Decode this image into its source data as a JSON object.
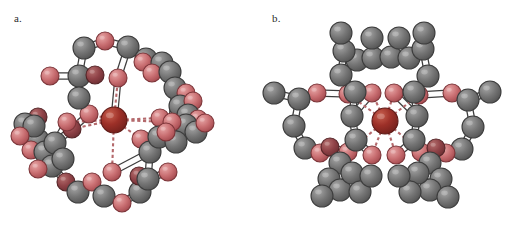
{
  "figure": {
    "background_color": "#ffffff",
    "width": 517,
    "height": 228,
    "panels": [
      {
        "id": "a",
        "label": "a.",
        "caption_text": "a.",
        "description": "Ball-and-stick molecular model of a macrocyclic host (crown-ether / cryptand type) viewed roughly down the cavity axis, with a central dark-red cation bound by dashed coordination bonds to surrounding oxygen atoms."
      },
      {
        "id": "b",
        "label": "b.",
        "caption_text": "b.",
        "description": "Ball-and-stick molecular model of a related macrocyclic host viewed edge-on, with a central dark-red cation radiating dashed coordination bonds to six oxygen atoms of the cavity."
      }
    ]
  },
  "legend": {
    "atom_types": [
      {
        "name": "carbon",
        "color": "#6e6e6e",
        "highlight": "#9a9a9a",
        "radius_px": 11
      },
      {
        "name": "oxygen",
        "color": "#c4656a",
        "highlight": "#e09a9c",
        "radius_px": 9
      },
      {
        "name": "oxygen-shaded",
        "color": "#8d3d42",
        "highlight": "#b56a6c",
        "radius_px": 9
      },
      {
        "name": "metal-cation",
        "color": "#9c2f2a",
        "highlight": "#c96056",
        "radius_px": 13
      }
    ],
    "bond_types": [
      {
        "name": "covalent-bond",
        "style": "solid-white-cylinder",
        "color": "#ffffff",
        "outline": "#3a3a3a"
      },
      {
        "name": "coordination-bond",
        "style": "dashed",
        "color": "#b06a6a"
      }
    ]
  },
  "structure_a": {
    "atoms": [
      {
        "id": 1,
        "type": "metal-cation",
        "x": 114,
        "y": 120,
        "r": 13
      },
      {
        "id": 2,
        "type": "oxygen",
        "x": 118,
        "y": 78,
        "r": 9
      },
      {
        "id": 3,
        "type": "oxygen",
        "x": 89,
        "y": 114,
        "r": 9
      },
      {
        "id": 4,
        "type": "oxygen",
        "x": 160,
        "y": 118,
        "r": 9
      },
      {
        "id": 5,
        "type": "oxygen",
        "x": 112,
        "y": 172,
        "r": 9
      },
      {
        "id": 6,
        "type": "oxygen-shaded",
        "x": 72,
        "y": 129,
        "r": 9
      },
      {
        "id": 7,
        "type": "oxygen",
        "x": 141,
        "y": 139,
        "r": 9
      },
      {
        "id": 8,
        "type": "carbon",
        "x": 84,
        "y": 48,
        "r": 11
      },
      {
        "id": 9,
        "type": "oxygen",
        "x": 105,
        "y": 41,
        "r": 9
      },
      {
        "id": 10,
        "type": "carbon",
        "x": 128,
        "y": 47,
        "r": 11
      },
      {
        "id": 11,
        "type": "carbon",
        "x": 146,
        "y": 59,
        "r": 11
      },
      {
        "id": 12,
        "type": "oxygen",
        "x": 143,
        "y": 62,
        "r": 9
      },
      {
        "id": 13,
        "type": "carbon",
        "x": 162,
        "y": 63,
        "r": 11
      },
      {
        "id": 14,
        "type": "oxygen",
        "x": 152,
        "y": 73,
        "r": 9
      },
      {
        "id": 15,
        "type": "carbon",
        "x": 170,
        "y": 72,
        "r": 11
      },
      {
        "id": 16,
        "type": "carbon",
        "x": 175,
        "y": 88,
        "r": 11
      },
      {
        "id": 17,
        "type": "oxygen",
        "x": 186,
        "y": 93,
        "r": 9
      },
      {
        "id": 18,
        "type": "carbon",
        "x": 180,
        "y": 106,
        "r": 11
      },
      {
        "id": 19,
        "type": "oxygen",
        "x": 193,
        "y": 101,
        "r": 9
      },
      {
        "id": 20,
        "type": "carbon",
        "x": 188,
        "y": 115,
        "r": 11
      },
      {
        "id": 21,
        "type": "oxygen",
        "x": 198,
        "y": 119,
        "r": 9
      },
      {
        "id": 22,
        "type": "carbon",
        "x": 186,
        "y": 125,
        "r": 11
      },
      {
        "id": 23,
        "type": "oxygen",
        "x": 172,
        "y": 122,
        "r": 9
      },
      {
        "id": 24,
        "type": "carbon",
        "x": 196,
        "y": 132,
        "r": 11
      },
      {
        "id": 25,
        "type": "oxygen",
        "x": 205,
        "y": 123,
        "r": 9
      },
      {
        "id": 26,
        "type": "carbon",
        "x": 79,
        "y": 76,
        "r": 11
      },
      {
        "id": 27,
        "type": "oxygen-shaded",
        "x": 95,
        "y": 75,
        "r": 9
      },
      {
        "id": 28,
        "type": "carbon",
        "x": 79,
        "y": 98,
        "r": 11
      },
      {
        "id": 29,
        "type": "oxygen",
        "x": 50,
        "y": 76,
        "r": 9
      },
      {
        "id": 30,
        "type": "oxygen-shaded",
        "x": 38,
        "y": 117,
        "r": 9
      },
      {
        "id": 31,
        "type": "carbon",
        "x": 25,
        "y": 124,
        "r": 11
      },
      {
        "id": 32,
        "type": "carbon",
        "x": 38,
        "y": 140,
        "r": 11
      },
      {
        "id": 33,
        "type": "oxygen",
        "x": 31,
        "y": 150,
        "r": 9
      },
      {
        "id": 34,
        "type": "carbon",
        "x": 45,
        "y": 152,
        "r": 11
      },
      {
        "id": 35,
        "type": "carbon",
        "x": 55,
        "y": 143,
        "r": 11
      },
      {
        "id": 36,
        "type": "oxygen",
        "x": 67,
        "y": 122,
        "r": 9
      },
      {
        "id": 37,
        "type": "carbon",
        "x": 52,
        "y": 166,
        "r": 11
      },
      {
        "id": 38,
        "type": "oxygen",
        "x": 38,
        "y": 169,
        "r": 9
      },
      {
        "id": 39,
        "type": "oxygen-shaded",
        "x": 66,
        "y": 182,
        "r": 9
      },
      {
        "id": 40,
        "type": "carbon",
        "x": 78,
        "y": 192,
        "r": 11
      },
      {
        "id": 41,
        "type": "oxygen",
        "x": 92,
        "y": 182,
        "r": 9
      },
      {
        "id": 42,
        "type": "carbon",
        "x": 104,
        "y": 196,
        "r": 11
      },
      {
        "id": 43,
        "type": "oxygen",
        "x": 122,
        "y": 203,
        "r": 9
      },
      {
        "id": 44,
        "type": "carbon",
        "x": 140,
        "y": 192,
        "r": 11
      },
      {
        "id": 45,
        "type": "oxygen-shaded",
        "x": 139,
        "y": 176,
        "r": 9
      },
      {
        "id": 46,
        "type": "carbon",
        "x": 148,
        "y": 179,
        "r": 11
      },
      {
        "id": 47,
        "type": "oxygen",
        "x": 168,
        "y": 172,
        "r": 9
      },
      {
        "id": 48,
        "type": "carbon",
        "x": 150,
        "y": 152,
        "r": 11
      },
      {
        "id": 49,
        "type": "carbon",
        "x": 159,
        "y": 137,
        "r": 11
      },
      {
        "id": 50,
        "type": "carbon",
        "x": 176,
        "y": 142,
        "r": 11
      },
      {
        "id": 51,
        "type": "oxygen",
        "x": 166,
        "y": 132,
        "r": 9
      },
      {
        "id": 52,
        "type": "carbon",
        "x": 34,
        "y": 126,
        "r": 11
      },
      {
        "id": 53,
        "type": "oxygen",
        "x": 20,
        "y": 136,
        "r": 9
      },
      {
        "id": 54,
        "type": "carbon",
        "x": 63,
        "y": 159,
        "r": 11
      }
    ],
    "covalent_bonds": [
      [
        8,
        9
      ],
      [
        9,
        10
      ],
      [
        10,
        11
      ],
      [
        11,
        13
      ],
      [
        13,
        15
      ],
      [
        15,
        16
      ],
      [
        16,
        18
      ],
      [
        18,
        20
      ],
      [
        20,
        22
      ],
      [
        22,
        24
      ],
      [
        8,
        26
      ],
      [
        26,
        28
      ],
      [
        28,
        3
      ],
      [
        26,
        29
      ],
      [
        26,
        27
      ],
      [
        31,
        32
      ],
      [
        32,
        34
      ],
      [
        34,
        35
      ],
      [
        35,
        36
      ],
      [
        34,
        37
      ],
      [
        37,
        39
      ],
      [
        39,
        40
      ],
      [
        40,
        41
      ],
      [
        41,
        42
      ],
      [
        42,
        43
      ],
      [
        43,
        44
      ],
      [
        44,
        46
      ],
      [
        46,
        47
      ],
      [
        46,
        48
      ],
      [
        48,
        49
      ],
      [
        49,
        50
      ],
      [
        49,
        7
      ],
      [
        48,
        5
      ],
      [
        16,
        23
      ],
      [
        22,
        4
      ],
      [
        20,
        21
      ],
      [
        24,
        25
      ],
      [
        18,
        19
      ],
      [
        2,
        10
      ],
      [
        2,
        1
      ],
      [
        31,
        30
      ],
      [
        32,
        33
      ],
      [
        37,
        38
      ],
      [
        35,
        6
      ],
      [
        6,
        3
      ],
      [
        13,
        14
      ],
      [
        11,
        12
      ],
      [
        52,
        53
      ]
    ],
    "coordination_bonds": [
      [
        1,
        2
      ],
      [
        1,
        3
      ],
      [
        1,
        4
      ],
      [
        1,
        5
      ],
      [
        1,
        6
      ],
      [
        1,
        7
      ],
      [
        1,
        23
      ],
      [
        1,
        36
      ]
    ],
    "atom_count": 54,
    "central_cation_position": {
      "x": 114,
      "y": 120
    }
  },
  "structure_b": {
    "atoms": [
      {
        "id": 1,
        "type": "metal-cation",
        "x": 385,
        "y": 121,
        "r": 13
      },
      {
        "id": 2,
        "type": "oxygen",
        "x": 372,
        "y": 93,
        "r": 9
      },
      {
        "id": 3,
        "type": "oxygen",
        "x": 394,
        "y": 93,
        "r": 9
      },
      {
        "id": 4,
        "type": "oxygen",
        "x": 372,
        "y": 155,
        "r": 9
      },
      {
        "id": 5,
        "type": "oxygen",
        "x": 396,
        "y": 155,
        "r": 9
      },
      {
        "id": 6,
        "type": "oxygen",
        "x": 348,
        "y": 94,
        "r": 9
      },
      {
        "id": 7,
        "type": "oxygen",
        "x": 419,
        "y": 95,
        "r": 9
      },
      {
        "id": 8,
        "type": "oxygen",
        "x": 348,
        "y": 152,
        "r": 9
      },
      {
        "id": 9,
        "type": "oxygen",
        "x": 421,
        "y": 152,
        "r": 9
      },
      {
        "id": 10,
        "type": "carbon",
        "x": 341,
        "y": 75,
        "r": 11
      },
      {
        "id": 11,
        "type": "carbon",
        "x": 357,
        "y": 60,
        "r": 11
      },
      {
        "id": 12,
        "type": "carbon",
        "x": 344,
        "y": 51,
        "r": 11
      },
      {
        "id": 13,
        "type": "carbon",
        "x": 341,
        "y": 33,
        "r": 11
      },
      {
        "id": 14,
        "type": "carbon",
        "x": 373,
        "y": 58,
        "r": 11
      },
      {
        "id": 15,
        "type": "carbon",
        "x": 372,
        "y": 38,
        "r": 11
      },
      {
        "id": 16,
        "type": "carbon",
        "x": 391,
        "y": 57,
        "r": 11
      },
      {
        "id": 17,
        "type": "carbon",
        "x": 399,
        "y": 38,
        "r": 11
      },
      {
        "id": 18,
        "type": "carbon",
        "x": 409,
        "y": 58,
        "r": 11
      },
      {
        "id": 19,
        "type": "carbon",
        "x": 423,
        "y": 49,
        "r": 11
      },
      {
        "id": 20,
        "type": "carbon",
        "x": 424,
        "y": 33,
        "r": 11
      },
      {
        "id": 21,
        "type": "carbon",
        "x": 428,
        "y": 76,
        "r": 11
      },
      {
        "id": 22,
        "type": "carbon",
        "x": 355,
        "y": 92,
        "r": 11
      },
      {
        "id": 23,
        "type": "carbon",
        "x": 414,
        "y": 92,
        "r": 11
      },
      {
        "id": 24,
        "type": "carbon",
        "x": 352,
        "y": 116,
        "r": 11
      },
      {
        "id": 25,
        "type": "carbon",
        "x": 417,
        "y": 116,
        "r": 11
      },
      {
        "id": 26,
        "type": "carbon",
        "x": 356,
        "y": 140,
        "r": 11
      },
      {
        "id": 27,
        "type": "carbon",
        "x": 414,
        "y": 140,
        "r": 11
      },
      {
        "id": 28,
        "type": "oxygen",
        "x": 317,
        "y": 93,
        "r": 9
      },
      {
        "id": 29,
        "type": "carbon",
        "x": 299,
        "y": 99,
        "r": 11
      },
      {
        "id": 30,
        "type": "carbon",
        "x": 274,
        "y": 93,
        "r": 11
      },
      {
        "id": 31,
        "type": "carbon",
        "x": 294,
        "y": 126,
        "r": 11
      },
      {
        "id": 32,
        "type": "carbon",
        "x": 305,
        "y": 148,
        "r": 11
      },
      {
        "id": 33,
        "type": "oxygen",
        "x": 320,
        "y": 153,
        "r": 9
      },
      {
        "id": 34,
        "type": "oxygen-shaded",
        "x": 330,
        "y": 147,
        "r": 9
      },
      {
        "id": 35,
        "type": "oxygen",
        "x": 452,
        "y": 93,
        "r": 9
      },
      {
        "id": 36,
        "type": "carbon",
        "x": 468,
        "y": 100,
        "r": 11
      },
      {
        "id": 37,
        "type": "carbon",
        "x": 490,
        "y": 92,
        "r": 11
      },
      {
        "id": 38,
        "type": "carbon",
        "x": 473,
        "y": 127,
        "r": 11
      },
      {
        "id": 39,
        "type": "carbon",
        "x": 462,
        "y": 149,
        "r": 11
      },
      {
        "id": 40,
        "type": "oxygen",
        "x": 446,
        "y": 153,
        "r": 9
      },
      {
        "id": 41,
        "type": "oxygen-shaded",
        "x": 436,
        "y": 148,
        "r": 9
      },
      {
        "id": 42,
        "type": "carbon",
        "x": 340,
        "y": 163,
        "r": 11
      },
      {
        "id": 43,
        "type": "carbon",
        "x": 329,
        "y": 179,
        "r": 11
      },
      {
        "id": 44,
        "type": "carbon",
        "x": 340,
        "y": 190,
        "r": 11
      },
      {
        "id": 45,
        "type": "carbon",
        "x": 322,
        "y": 196,
        "r": 11
      },
      {
        "id": 46,
        "type": "carbon",
        "x": 352,
        "y": 173,
        "r": 11
      },
      {
        "id": 47,
        "type": "carbon",
        "x": 360,
        "y": 192,
        "r": 11
      },
      {
        "id": 48,
        "type": "carbon",
        "x": 430,
        "y": 163,
        "r": 11
      },
      {
        "id": 49,
        "type": "carbon",
        "x": 441,
        "y": 179,
        "r": 11
      },
      {
        "id": 50,
        "type": "carbon",
        "x": 430,
        "y": 190,
        "r": 11
      },
      {
        "id": 51,
        "type": "carbon",
        "x": 448,
        "y": 197,
        "r": 11
      },
      {
        "id": 52,
        "type": "carbon",
        "x": 418,
        "y": 173,
        "r": 11
      },
      {
        "id": 53,
        "type": "carbon",
        "x": 410,
        "y": 192,
        "r": 11
      },
      {
        "id": 54,
        "type": "carbon",
        "x": 371,
        "y": 176,
        "r": 11
      },
      {
        "id": 55,
        "type": "carbon",
        "x": 399,
        "y": 176,
        "r": 11
      }
    ],
    "covalent_bonds": [
      [
        10,
        11
      ],
      [
        11,
        12
      ],
      [
        12,
        13
      ],
      [
        11,
        14
      ],
      [
        14,
        15
      ],
      [
        14,
        16
      ],
      [
        16,
        17
      ],
      [
        16,
        18
      ],
      [
        18,
        19
      ],
      [
        19,
        20
      ],
      [
        19,
        21
      ],
      [
        10,
        22
      ],
      [
        21,
        23
      ],
      [
        22,
        6
      ],
      [
        23,
        7
      ],
      [
        22,
        24
      ],
      [
        23,
        25
      ],
      [
        24,
        26
      ],
      [
        25,
        27
      ],
      [
        24,
        2
      ],
      [
        25,
        3
      ],
      [
        26,
        4
      ],
      [
        27,
        5
      ],
      [
        26,
        8
      ],
      [
        27,
        9
      ],
      [
        6,
        28
      ],
      [
        28,
        29
      ],
      [
        29,
        30
      ],
      [
        29,
        31
      ],
      [
        31,
        32
      ],
      [
        32,
        33
      ],
      [
        33,
        8
      ],
      [
        34,
        8
      ],
      [
        7,
        35
      ],
      [
        35,
        36
      ],
      [
        36,
        37
      ],
      [
        36,
        38
      ],
      [
        38,
        39
      ],
      [
        39,
        40
      ],
      [
        40,
        9
      ],
      [
        41,
        9
      ],
      [
        26,
        42
      ],
      [
        42,
        43
      ],
      [
        43,
        44
      ],
      [
        44,
        45
      ],
      [
        43,
        46
      ],
      [
        46,
        47
      ],
      [
        46,
        54
      ],
      [
        27,
        48
      ],
      [
        48,
        49
      ],
      [
        49,
        50
      ],
      [
        50,
        51
      ],
      [
        49,
        52
      ],
      [
        52,
        53
      ],
      [
        52,
        55
      ],
      [
        2,
        22
      ],
      [
        3,
        23
      ],
      [
        12,
        10
      ]
    ],
    "coordination_bonds": [
      [
        1,
        2
      ],
      [
        1,
        3
      ],
      [
        1,
        4
      ],
      [
        1,
        5
      ],
      [
        1,
        6
      ],
      [
        1,
        7
      ],
      [
        1,
        8
      ],
      [
        1,
        9
      ]
    ],
    "atom_count": 55,
    "central_cation_position": {
      "x": 385,
      "y": 121
    }
  }
}
